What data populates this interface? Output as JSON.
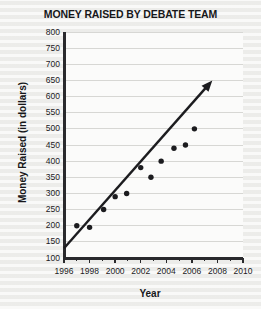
{
  "chart_data": {
    "type": "scatter",
    "title": "MONEY RAISED BY DEBATE TEAM",
    "xlabel": "Year",
    "ylabel": "Money Raised (in dollars)",
    "xlim": [
      1996,
      2010
    ],
    "ylim": [
      100,
      800
    ],
    "xticks": [
      1996,
      1998,
      2000,
      2002,
      2004,
      2006,
      2008,
      2010
    ],
    "xtick_labels": [
      "1996",
      "1998",
      "2000",
      "2002",
      "2004",
      "2006",
      "2008",
      "2010"
    ],
    "xminor_ticks": [
      1997,
      1999,
      2001,
      2003,
      2005,
      2007,
      2009
    ],
    "yticks": [
      100,
      150,
      200,
      250,
      300,
      350,
      400,
      450,
      500,
      550,
      600,
      650,
      700,
      750,
      800
    ],
    "ytick_labels": [
      "100",
      "150",
      "200",
      "250",
      "300",
      "350",
      "400",
      "450",
      "500",
      "550",
      "600",
      "650",
      "700",
      "750",
      "800"
    ],
    "grid": "horizontal",
    "legend": "none",
    "points": [
      {
        "x": 1997.0,
        "y": 200
      },
      {
        "x": 1998.0,
        "y": 195
      },
      {
        "x": 1999.1,
        "y": 250
      },
      {
        "x": 2000.0,
        "y": 290
      },
      {
        "x": 2000.9,
        "y": 300
      },
      {
        "x": 2002.0,
        "y": 380
      },
      {
        "x": 2002.8,
        "y": 350
      },
      {
        "x": 2003.6,
        "y": 400
      },
      {
        "x": 2004.6,
        "y": 440
      },
      {
        "x": 2005.5,
        "y": 450
      },
      {
        "x": 2006.2,
        "y": 500
      }
    ],
    "trend_line": {
      "style": "solid-arrow",
      "start": {
        "x": 1996.0,
        "y": 130
      },
      "end": {
        "x": 2007.6,
        "y": 650
      },
      "arrowhead": "end"
    },
    "colors": {
      "background": "#f2f2f0",
      "plot_background": "#fbfbfa",
      "gridline": "#d7d7d4",
      "axis": "#2a2a2d",
      "marker": "#1c1c1f",
      "trend_line": "#1c1c1f",
      "text": "#17171a"
    }
  }
}
